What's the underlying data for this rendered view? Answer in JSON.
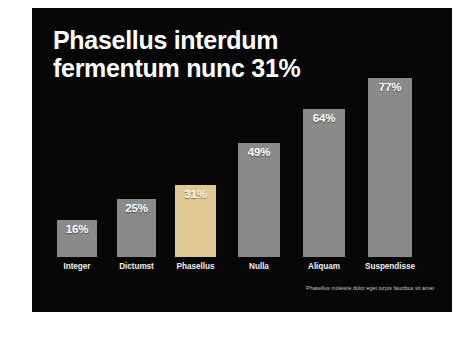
{
  "slide": {
    "background_color": "#070707",
    "page_background_color": "#ffffff",
    "title_line1": "Phasellus interdum",
    "title_line2": "fermentum nunc 31%",
    "title_full": "Phasellus interdum\nfermentum nunc 31%",
    "footnote": "Phasellus molestie dolor eget turpis faucibus sit amet"
  },
  "chart_data": {
    "type": "bar",
    "title": "Phasellus interdum fermentum nunc 31%",
    "xlabel": "",
    "ylabel": "",
    "ylim": [
      0,
      100
    ],
    "grid": false,
    "legend": false,
    "categories": [
      "Integer",
      "Dictumst",
      "Phasellus",
      "Nulla",
      "Aliquam",
      "Suspendisse"
    ],
    "values": [
      16,
      25,
      31,
      49,
      64,
      77
    ],
    "value_labels": [
      "16%",
      "25%",
      "31%",
      "49%",
      "64%",
      "77%"
    ],
    "highlight_index": 2,
    "bar_color": "#8a8a8a",
    "highlight_color": "#e0c893",
    "value_label_color": "#ffffff",
    "category_label_color": "#f2f2f2",
    "bars": [
      {
        "label": "Integer",
        "value": 16,
        "value_label": "16%",
        "color": "#8a8a8a",
        "highlight": false
      },
      {
        "label": "Dictumst",
        "value": 25,
        "value_label": "25%",
        "color": "#8a8a8a",
        "highlight": false
      },
      {
        "label": "Phasellus",
        "value": 31,
        "value_label": "31%",
        "color": "#e0c893",
        "highlight": true
      },
      {
        "label": "Nulla",
        "value": 49,
        "value_label": "49%",
        "color": "#8a8a8a",
        "highlight": false
      },
      {
        "label": "Aliquam",
        "value": 64,
        "value_label": "64%",
        "color": "#8a8a8a",
        "highlight": false
      },
      {
        "label": "Suspendisse",
        "value": 77,
        "value_label": "77%",
        "color": "#8a8a8a",
        "highlight": false
      }
    ]
  }
}
